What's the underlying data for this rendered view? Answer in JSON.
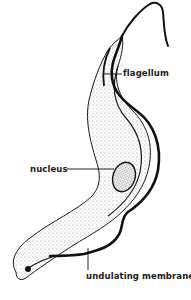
{
  "diagram": {
    "labels": {
      "flagellum": "flagellum",
      "nucleus": "nucleus",
      "undulating_membrane": "undulating membrane"
    },
    "colors": {
      "background": "#ffffff",
      "ink": "#1a1a1a",
      "stipple": "#333333"
    }
  }
}
